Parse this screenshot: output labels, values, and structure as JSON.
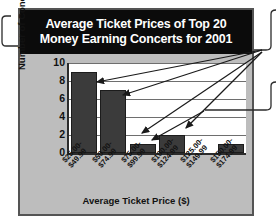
{
  "chart_data": {
    "type": "bar",
    "title": "Average Ticket Prices of Top 20 Money Earning Concerts for 2001",
    "title_line1": "Average Ticket Prices of Top 20",
    "title_line2": "Money Earning Concerts for 2001",
    "xlabel": "Average Ticket Price ($)",
    "ylabel": "Number of Concerts",
    "categories": [
      "$25.00-\n$49.99",
      "$50.00-\n$74.99",
      "$75.00-\n$99.99",
      "$100.00-\n$124.99",
      "$125.00-\n$149.99",
      "$150.00-\n$174.99"
    ],
    "category_lines": [
      [
        "$25.00-",
        "$49.99"
      ],
      [
        "$50.00-",
        "$74.99"
      ],
      [
        "$75.00-",
        "$99.99"
      ],
      [
        "$100.00-",
        "$124.99"
      ],
      [
        "$125.00-",
        "$149.99"
      ],
      [
        "$150.00-",
        "$174.99"
      ]
    ],
    "values": [
      9,
      7,
      1,
      2,
      0,
      1
    ],
    "ylim": [
      0,
      10
    ],
    "yticks": [
      0,
      2,
      4,
      6,
      8,
      10
    ],
    "ytick_labels": [
      "0",
      "2",
      "4",
      "6",
      "8",
      "10"
    ],
    "grid": true,
    "grid_axis": "y",
    "legend": false,
    "bar_color": "#3b3b3b",
    "plot_background": "#ffffff",
    "frame_background": "#bdbdbd",
    "title_background": "#0b0b0b",
    "title_color": "#ffffff"
  },
  "annotations": {
    "left_bracket": "callout-bracket-left",
    "right_bracket_top": "callout-bracket-right-top",
    "right_bracket_bottom": "callout-bracket-right-bottom",
    "arrow_count": 5,
    "arrows": [
      "arrow-to-bar-1",
      "arrow-to-bar-2",
      "arrow-to-bar-3",
      "arrow-to-bar-4",
      "arrow-to-bar-5"
    ]
  }
}
